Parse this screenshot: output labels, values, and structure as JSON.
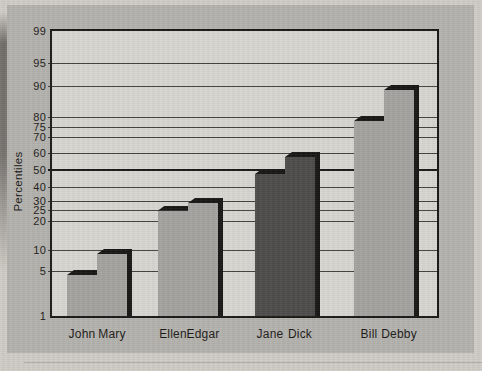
{
  "chart_data": {
    "type": "bar",
    "scale": "normal-probability",
    "title": "",
    "ylabel": "Percentiles",
    "categories": [
      "John",
      "Mary",
      "Ellen",
      "Edgar",
      "Jane",
      "Dick",
      "Bill",
      "Debby"
    ],
    "values": [
      5,
      10,
      27,
      31,
      50,
      60,
      80,
      90
    ],
    "pairs": [
      [
        "John",
        "Mary"
      ],
      [
        "Ellen",
        "Edgar"
      ],
      [
        "Jane",
        "Dick"
      ],
      [
        "Bill",
        "Debby"
      ]
    ],
    "highlighted_categories": [
      "Jane",
      "Dick"
    ],
    "yticks": [
      99,
      95,
      90,
      80,
      75,
      70,
      60,
      50,
      40,
      30,
      25,
      20,
      10,
      5,
      1
    ],
    "ylim": [
      1,
      99
    ],
    "grid": "horizontal",
    "reference_line": 50,
    "legend": "none"
  },
  "colors": {
    "page": "#d0cdc7",
    "figure_bg": "#b5b3ae",
    "plot_bg": "#d9d7d2",
    "grid_line": "#454340",
    "axis_line": "#1a1816",
    "bar_light": "#a5a39f",
    "bar_dark": "#4e4c4a",
    "bar_black": "#181614",
    "text": "#1c1a18"
  }
}
